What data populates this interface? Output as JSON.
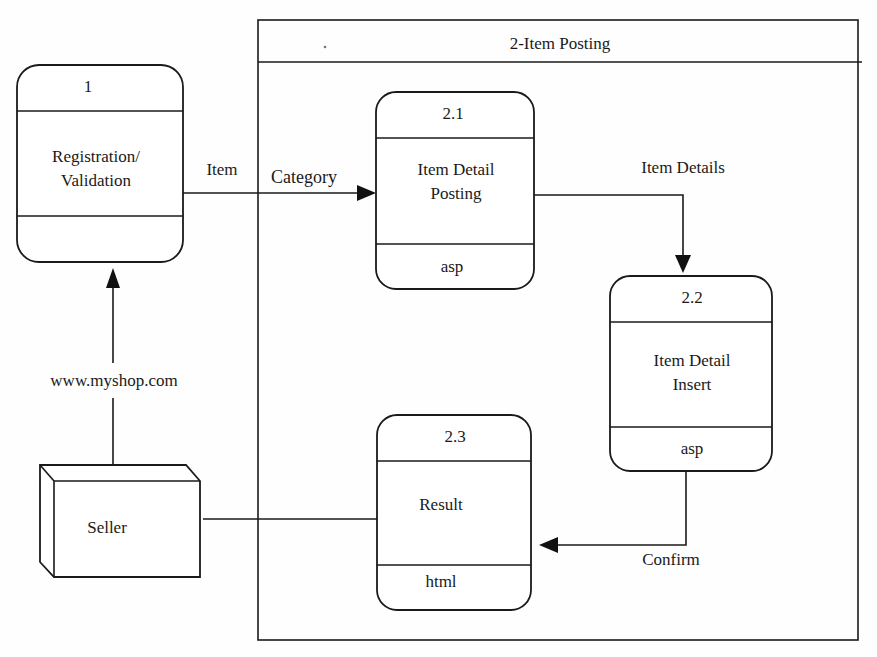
{
  "diagram": {
    "type": "data-flow-diagram",
    "container": {
      "title": "2-Item Posting"
    },
    "processes": [
      {
        "id": "1",
        "name": "Registration/\nValidation",
        "tech": ""
      },
      {
        "id": "2.1",
        "name": "Item Detail\nPosting",
        "tech": "asp"
      },
      {
        "id": "2.2",
        "name": "Item Detail\nInsert",
        "tech": "asp"
      },
      {
        "id": "2.3",
        "name": "Result",
        "tech": "html"
      }
    ],
    "external_entities": [
      {
        "name": "Seller"
      }
    ],
    "flows": [
      {
        "from": "Seller",
        "to": "1",
        "label": "www.myshop.com"
      },
      {
        "from": "1",
        "to": "2.1",
        "label": "Item"
      },
      {
        "from": "1",
        "to": "2.1",
        "label": "Category"
      },
      {
        "from": "2.1",
        "to": "2.2",
        "label": "Item Details"
      },
      {
        "from": "2.2",
        "to": "2.3",
        "label": "Confirm"
      },
      {
        "from": "2.3",
        "to": "Seller",
        "label": ""
      }
    ],
    "colors": {
      "line": "#1a1a1a",
      "background": "#fefefe"
    }
  }
}
